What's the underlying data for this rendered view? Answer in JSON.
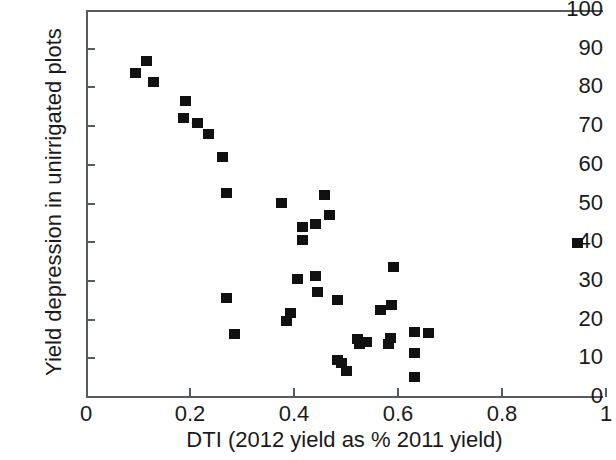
{
  "chart_data": {
    "type": "scatter",
    "title": "",
    "xlabel": "DTI (2012 yield as % 2011 yield)",
    "ylabel": "Yield depression in unirrigated plots",
    "xlim": [
      0,
      1.0
    ],
    "ylim": [
      0,
      100
    ],
    "xticks": [
      0,
      0.2,
      0.4,
      0.6,
      0.8,
      1
    ],
    "xtick_labels": [
      "0",
      "0.2",
      "0.4",
      "0.6",
      "0.8",
      "1"
    ],
    "yticks": [
      0,
      10,
      20,
      30,
      40,
      50,
      60,
      70,
      80,
      90,
      100
    ],
    "ytick_labels": [
      "0",
      "10",
      "20",
      "30",
      "40",
      "50",
      "60",
      "70",
      "80",
      "90",
      "100"
    ],
    "grid": false,
    "legend": null,
    "marker_shape": "square",
    "marker_color": "#111111",
    "axis_color": "#555b5e",
    "points": [
      {
        "x": 0.096,
        "y": 83.7
      },
      {
        "x": 0.117,
        "y": 86.8
      },
      {
        "x": 0.129,
        "y": 81.4
      },
      {
        "x": 0.192,
        "y": 76.5
      },
      {
        "x": 0.187,
        "y": 72.1
      },
      {
        "x": 0.215,
        "y": 70.8
      },
      {
        "x": 0.235,
        "y": 68.0
      },
      {
        "x": 0.262,
        "y": 62.0
      },
      {
        "x": 0.271,
        "y": 52.7
      },
      {
        "x": 0.271,
        "y": 25.6
      },
      {
        "x": 0.285,
        "y": 16.3
      },
      {
        "x": 0.375,
        "y": 50.1
      },
      {
        "x": 0.385,
        "y": 19.6
      },
      {
        "x": 0.394,
        "y": 21.7
      },
      {
        "x": 0.406,
        "y": 30.5
      },
      {
        "x": 0.417,
        "y": 43.9
      },
      {
        "x": 0.417,
        "y": 40.6
      },
      {
        "x": 0.442,
        "y": 44.7
      },
      {
        "x": 0.442,
        "y": 31.3
      },
      {
        "x": 0.446,
        "y": 27.1
      },
      {
        "x": 0.458,
        "y": 52.2
      },
      {
        "x": 0.469,
        "y": 47.0
      },
      {
        "x": 0.483,
        "y": 25.1
      },
      {
        "x": 0.483,
        "y": 9.6
      },
      {
        "x": 0.492,
        "y": 8.8
      },
      {
        "x": 0.5,
        "y": 6.7
      },
      {
        "x": 0.523,
        "y": 15.0
      },
      {
        "x": 0.525,
        "y": 13.7
      },
      {
        "x": 0.54,
        "y": 14.2
      },
      {
        "x": 0.566,
        "y": 22.5
      },
      {
        "x": 0.581,
        "y": 13.7
      },
      {
        "x": 0.585,
        "y": 15.2
      },
      {
        "x": 0.587,
        "y": 23.8
      },
      {
        "x": 0.592,
        "y": 33.7
      },
      {
        "x": 0.631,
        "y": 16.8
      },
      {
        "x": 0.631,
        "y": 11.4
      },
      {
        "x": 0.631,
        "y": 5.2
      },
      {
        "x": 0.658,
        "y": 16.5
      },
      {
        "x": 0.946,
        "y": 39.8
      }
    ]
  }
}
